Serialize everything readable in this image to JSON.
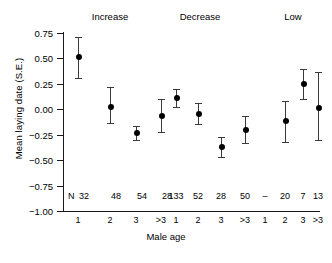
{
  "chart_data": {
    "type": "scatter",
    "title": "",
    "xlabel": "Male age",
    "ylabel": "Mean laying date (S.E.)",
    "ylim": [
      -1.0,
      0.75
    ],
    "yticks": [
      0.75,
      0.5,
      0.25,
      0.0,
      -0.25,
      -0.5,
      -0.75,
      -1.0
    ],
    "ytick_labels": [
      "0.75",
      "0.50",
      "0.25",
      "0.00",
      "−0.25",
      "−0.50",
      "−0.75",
      "−1.00"
    ],
    "grid": false,
    "legend": "none",
    "error_type": "S.E.",
    "categories": [
      "1",
      "2",
      "3",
      ">3"
    ],
    "sample_size_label": "N",
    "panels": [
      {
        "name": "Increase",
        "points": [
          {
            "x": "1",
            "y": 0.51,
            "lo": 0.31,
            "hi": 0.71,
            "n": "32"
          },
          {
            "x": "2",
            "y": 0.02,
            "lo": -0.13,
            "hi": 0.22,
            "n": "48"
          },
          {
            "x": "3",
            "y": -0.23,
            "lo": -0.3,
            "hi": -0.16,
            "n": "54"
          },
          {
            "x": ">3",
            "y": -0.07,
            "lo": -0.22,
            "hi": 0.1,
            "n": "28"
          }
        ]
      },
      {
        "name": "Decrease",
        "points": [
          {
            "x": "1",
            "y": 0.11,
            "lo": 0.02,
            "hi": 0.2,
            "n": "133"
          },
          {
            "x": "2",
            "y": -0.05,
            "lo": -0.14,
            "hi": 0.06,
            "n": "52"
          },
          {
            "x": "3",
            "y": -0.37,
            "lo": -0.47,
            "hi": -0.27,
            "n": "28"
          },
          {
            "x": ">3",
            "y": -0.2,
            "lo": -0.33,
            "hi": -0.07,
            "n": "50"
          }
        ]
      },
      {
        "name": "Low",
        "points": [
          {
            "x": "1",
            "y": null,
            "lo": null,
            "hi": null,
            "n": "–"
          },
          {
            "x": "2",
            "y": -0.12,
            "lo": -0.32,
            "hi": 0.08,
            "n": "20"
          },
          {
            "x": "3",
            "y": 0.25,
            "lo": 0.1,
            "hi": 0.4,
            "n": "7"
          },
          {
            "x": ">3",
            "y": 0.01,
            "lo": -0.3,
            "hi": 0.37,
            "n": "13"
          }
        ]
      }
    ]
  }
}
